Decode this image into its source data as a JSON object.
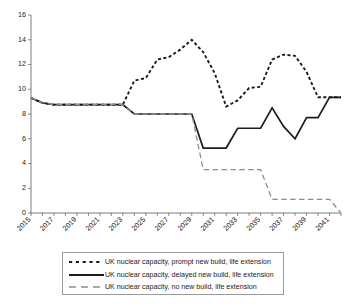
{
  "chart_data": {
    "type": "line",
    "title": "",
    "subtitle": "",
    "xlabel": "",
    "ylabel": "",
    "xlim": [
      2015,
      2042
    ],
    "ylim": [
      0,
      16
    ],
    "yticks": [
      0,
      2,
      4,
      6,
      8,
      10,
      12,
      14,
      16
    ],
    "xticks": [
      2015,
      2017,
      2019,
      2021,
      2023,
      2025,
      2027,
      2029,
      2031,
      2033,
      2035,
      2037,
      2039,
      2041
    ],
    "xtick_labels": [
      "2015",
      "2017",
      "2019",
      "2021",
      "2023",
      "2025",
      "2027",
      "2029",
      "2031",
      "2033",
      "2035",
      "2037",
      "2039",
      "2041"
    ],
    "grid": false,
    "legend_position": "bottom",
    "x": [
      2015,
      2016,
      2017,
      2018,
      2019,
      2020,
      2021,
      2022,
      2023,
      2024,
      2025,
      2026,
      2027,
      2028,
      2029,
      2030,
      2031,
      2032,
      2033,
      2034,
      2035,
      2036,
      2037,
      2038,
      2039,
      2040,
      2041,
      2042
    ],
    "series": [
      {
        "name": "UK nuclear capacity, prompt new build, life extension",
        "style": "dotted",
        "color": "#1c1c1c",
        "values": [
          9.3,
          8.9,
          8.75,
          8.75,
          8.75,
          8.75,
          8.75,
          8.75,
          8.75,
          10.7,
          10.9,
          12.4,
          12.6,
          13.2,
          14.0,
          13.0,
          11.3,
          8.6,
          9.1,
          10.1,
          10.2,
          12.4,
          12.8,
          12.7,
          11.4,
          9.35,
          9.35,
          9.35
        ]
      },
      {
        "name": "UK nuclear capacity, delayed new build, life extension",
        "style": "solid",
        "color": "#1c1c1c",
        "values": [
          9.3,
          8.9,
          8.75,
          8.75,
          8.75,
          8.75,
          8.75,
          8.75,
          8.75,
          8.0,
          8.0,
          8.0,
          8.0,
          8.0,
          8.0,
          5.25,
          5.25,
          5.25,
          6.85,
          6.85,
          6.85,
          8.5,
          7.0,
          6.0,
          7.7,
          7.7,
          9.35,
          9.35
        ]
      },
      {
        "name": "UK nuclear capacity, no new build, life extension",
        "style": "dashed",
        "color": "#8e8e8e",
        "values": [
          9.3,
          8.9,
          8.75,
          8.75,
          8.75,
          8.75,
          8.75,
          8.75,
          8.75,
          8.0,
          8.0,
          8.0,
          8.0,
          8.0,
          8.0,
          3.5,
          3.5,
          3.5,
          3.5,
          3.5,
          3.5,
          1.1,
          1.1,
          1.1,
          1.1,
          1.1,
          1.1,
          0.0
        ]
      }
    ],
    "series_tail": {
      "prompt_2037_2042": [
        9.35,
        9.35,
        9.35,
        9.35,
        8.2,
        8.2
      ],
      "delayed_2037_2042": [
        9.35,
        9.35,
        9.35,
        9.35,
        8.2,
        8.2
      ]
    }
  },
  "legend": {
    "entries": [
      {
        "label": "UK nuclear capacity, prompt new build, life extension",
        "marker": "dotted-line-swatch"
      },
      {
        "label": "UK nuclear capacity, delayed new build, life extension",
        "marker": "solid-line-swatch"
      },
      {
        "label": "UK nuclear capacity, no new build, life extension",
        "marker": "dashed-line-swatch"
      }
    ]
  },
  "axes": {
    "y_labels": [
      "16",
      "14",
      "12",
      "10",
      "8",
      "6",
      "4",
      "2",
      "0"
    ],
    "x_labels": [
      "2015",
      "2017",
      "2019",
      "2021",
      "2023",
      "2025",
      "2027",
      "2029",
      "2031",
      "2033",
      "2035",
      "2037",
      "2039",
      "2041"
    ]
  }
}
